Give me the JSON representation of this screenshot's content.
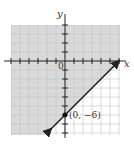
{
  "chart_data": {
    "type": "line",
    "title": "",
    "xlabel": "x",
    "ylabel": "y",
    "xlim": [
      -6,
      6
    ],
    "ylim": [
      -8,
      4
    ],
    "grid": true,
    "origin_label": "0",
    "series": [
      {
        "name": "boundary",
        "equation": "y = x - 6",
        "style": "solid",
        "x": [
          -5.5,
          6
        ],
        "y": [
          -11.5,
          0
        ]
      }
    ],
    "shaded_region": "y >= x - 6 (above/left of line)",
    "annotations": [
      {
        "text": "(0, −6)",
        "x": 0,
        "y": -6
      }
    ],
    "colors": {
      "shade": "#d9d9d9",
      "grid": "#bfbfbf",
      "line": "#222222"
    }
  },
  "labels": {
    "x_axis": "x",
    "y_axis": "y",
    "origin": "0",
    "point": "(0, −6)"
  }
}
